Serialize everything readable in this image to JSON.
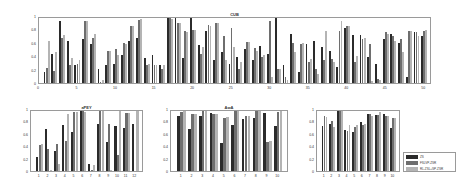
{
  "legend": {
    "entries": [
      {
        "name": "ZS",
        "color": "#2b2b2b"
      },
      {
        "name": "FSLVP-ZSR",
        "color": "#6e6e6e"
      },
      {
        "name": "RL-ZSL+SP-ZSR",
        "color": "#b4b4b4"
      }
    ]
  },
  "chart_data": [
    {
      "type": "bar",
      "title": "CUB",
      "xlabel": "",
      "ylabel": "",
      "ylim": [
        0,
        1
      ],
      "yticks": [
        0,
        0.2,
        0.4,
        0.6,
        0.8,
        1
      ],
      "xticks": [
        5,
        10,
        15,
        20,
        25,
        30,
        35,
        40,
        45,
        50
      ],
      "categories": [
        1,
        2,
        3,
        4,
        5,
        6,
        7,
        8,
        9,
        10,
        11,
        12,
        13,
        14,
        15,
        16,
        17,
        18,
        19,
        20,
        21,
        22,
        23,
        24,
        25,
        26,
        27,
        28,
        29,
        30,
        31,
        32,
        33,
        34,
        35,
        36,
        37,
        38,
        39,
        40,
        41,
        42,
        43,
        44,
        45,
        46,
        47,
        48,
        49,
        50
      ],
      "series": [
        {
          "name": "ZS",
          "values": [
            0.17,
            0.45,
            0.96,
            0.64,
            0.28,
            0.68,
            0.6,
            0.21,
            0.28,
            0.29,
            0.43,
            0.65,
            0.7,
            0.38,
            0.43,
            0.28,
            1.0,
            1.0,
            0.38,
            1.0,
            0.59,
            0.8,
            0.36,
            0.47,
            0.3,
            0.4,
            0.52,
            0.35,
            0.57,
            0.44,
            1.0,
            0.27,
            0.75,
            0.17,
            0.6,
            0.65,
            0.55,
            0.5,
            0.25,
            0.85,
            0.74,
            0.74,
            0.4,
            0.3,
            0.68,
            0.75,
            0.62,
            0.09,
            0.78,
            0.72
          ]
        },
        {
          "name": "FSLVP-ZSR",
          "values": [
            0.23,
            0.18,
            0.7,
            0.28,
            0.3,
            0.95,
            0.7,
            0.02,
            0.5,
            0.52,
            0.62,
            0.88,
            0.97,
            0.28,
            0.28,
            0.22,
            1.0,
            0.93,
            0.8,
            0.82,
            0.44,
            0.89,
            0.93,
            0.72,
            0.85,
            0.22,
            0.63,
            0.54,
            0.4,
            0.95,
            0.22,
            0.1,
            0.62,
            0.6,
            0.32,
            0.22,
            0.36,
            0.37,
            0.8,
            0.88,
            0.32,
            0.68,
            0.6,
            0.06,
            0.79,
            0.72,
            0.68,
            0.8,
            0.78,
            0.8
          ]
        },
        {
          "name": "RL-ZSL+SP-ZSR",
          "values": [
            0.65,
            0.48,
            0.74,
            0.38,
            0.35,
            0.95,
            0.75,
            0.05,
            0.5,
            0.43,
            0.6,
            0.88,
            0.99,
            0.3,
            0.28,
            0.27,
            0.99,
            0.93,
            0.78,
            0.82,
            0.55,
            0.88,
            0.93,
            0.35,
            0.55,
            0.33,
            0.63,
            0.5,
            0.43,
            0.1,
            0.22,
            0.05,
            0.48,
            0.62,
            0.37,
            0.14,
            0.8,
            0.33,
            0.95,
            0.88,
            0.42,
            0.7,
            0.03,
            0.05,
            0.75,
            0.65,
            0.48,
            0.8,
            0.72,
            0.82
          ]
        }
      ]
    },
    {
      "type": "bar",
      "title": "aPEY",
      "ylim": [
        0,
        1
      ],
      "yticks": [
        0,
        0.2,
        0.4,
        0.6,
        0.8,
        1
      ],
      "categories": [
        1,
        2,
        3,
        4,
        5,
        6,
        7,
        8,
        9,
        10,
        11,
        12
      ],
      "series": [
        {
          "name": "ZS",
          "values": [
            0.23,
            0.7,
            0.34,
            0.76,
            0.65,
            1.0,
            0.11,
            0.78,
            0.49,
            0.75,
            0.72,
            0.79
          ]
        },
        {
          "name": "FSLVP-ZSR",
          "values": [
            0.43,
            0.37,
            0.45,
            0.5,
            0.99,
            1.0,
            0.01,
            1.0,
            0.79,
            0.27,
            0.96,
            0.0
          ]
        },
        {
          "name": "RL-ZSL+SP-ZSR",
          "values": [
            0.45,
            0.02,
            0.12,
            0.95,
            0.99,
            0.99,
            0.1,
            1.0,
            0.02,
            1.0,
            0.96,
            1.0
          ]
        }
      ]
    },
    {
      "type": "bar",
      "title": "AwA",
      "ylim": [
        0,
        1
      ],
      "yticks": [
        0,
        0.2,
        0.4,
        0.6,
        0.8,
        1
      ],
      "categories": [
        1,
        2,
        3,
        4,
        5,
        6,
        7,
        8,
        9,
        10
      ],
      "series": [
        {
          "name": "ZS",
          "values": [
            0.91,
            0.7,
            0.92,
            0.96,
            0.47,
            0.76,
            0.86,
            0.88,
            0.97,
            0.75
          ]
        },
        {
          "name": "FSLVP-ZSR",
          "values": [
            0.99,
            0.95,
            1.0,
            0.95,
            0.89,
            1.0,
            0.91,
            1.0,
            0.49,
            0.98
          ]
        },
        {
          "name": "RL-ZSL+SP-ZSR",
          "values": [
            1.0,
            0.95,
            1.0,
            0.95,
            0.9,
            1.0,
            0.92,
            1.0,
            0.5,
            1.0
          ]
        }
      ]
    },
    {
      "type": "bar",
      "title": "",
      "ylim": [
        0,
        1
      ],
      "yticks": [
        0,
        0.2,
        0.4,
        0.6,
        0.8,
        1
      ],
      "categories": [
        1,
        2,
        3,
        4,
        5,
        6,
        7,
        8,
        9,
        10
      ],
      "series": [
        {
          "name": "ZS",
          "values": [
            0.75,
            0.79,
            1.0,
            0.68,
            0.65,
            0.82,
            0.95,
            0.94,
            0.95,
            0.71
          ]
        },
        {
          "name": "FSLVP-ZSR",
          "values": [
            0.92,
            0.83,
            1.0,
            0.66,
            0.74,
            0.76,
            0.95,
            0.94,
            0.91,
            0.88
          ]
        },
        {
          "name": "RL-ZSL+SP-ZSR",
          "values": [
            0.9,
            0.73,
            1.0,
            0.77,
            0.76,
            0.78,
            0.92,
            0.99,
            0.91,
            0.88
          ]
        }
      ]
    }
  ]
}
